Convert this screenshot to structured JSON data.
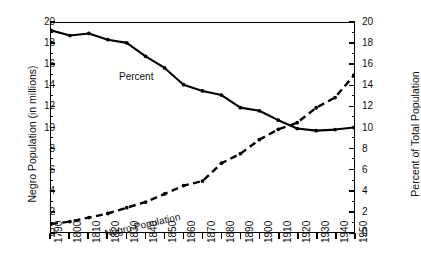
{
  "chart_data": {
    "type": "line",
    "title": "",
    "xlabel": "",
    "ylabel": "Negro Population (in millions)",
    "ylabel_right": "Percent of Total Population",
    "xlim": [
      1790,
      1950
    ],
    "ylim": [
      0,
      20
    ],
    "ylim_right": [
      0,
      20
    ],
    "grid": false,
    "legend": "inline",
    "x": [
      1790,
      1800,
      1810,
      1820,
      1830,
      1840,
      1850,
      1860,
      1870,
      1880,
      1890,
      1900,
      1910,
      1920,
      1930,
      1940,
      1950
    ],
    "xtick_labels": [
      "1790",
      "1800",
      "1810",
      "1820",
      "1830",
      "1840",
      "1850",
      "1860",
      "1870",
      "1880",
      "1890",
      "1900",
      "1910",
      "1920",
      "1930",
      "1940",
      "1950"
    ],
    "ytick_labels": [
      "0",
      "2",
      "4",
      "6",
      "8",
      "10",
      "12",
      "14",
      "16",
      "18",
      "20"
    ],
    "ytick_labels_right": [
      "0",
      "2",
      "4",
      "6",
      "8",
      "10",
      "12",
      "14",
      "16",
      "18",
      "20"
    ],
    "series": [
      {
        "name": "Percent",
        "axis": "right",
        "style": "solid",
        "color": "#000000",
        "values": [
          19.3,
          18.8,
          19.0,
          18.4,
          18.1,
          16.8,
          15.7,
          14.1,
          13.5,
          13.1,
          11.9,
          11.6,
          10.7,
          9.9,
          9.7,
          9.8,
          10.0
        ]
      },
      {
        "name": "Negro Population",
        "axis": "left",
        "style": "dashed",
        "color": "#000000",
        "values": [
          0.76,
          1.0,
          1.38,
          1.77,
          2.33,
          2.87,
          3.64,
          4.44,
          4.88,
          6.58,
          7.49,
          8.83,
          9.83,
          10.46,
          11.89,
          12.87,
          15.0
        ]
      }
    ],
    "annotations": [
      {
        "name": "percent-series-label",
        "text": "Percent"
      },
      {
        "name": "population-series-label",
        "text": "Negro Population"
      }
    ]
  }
}
